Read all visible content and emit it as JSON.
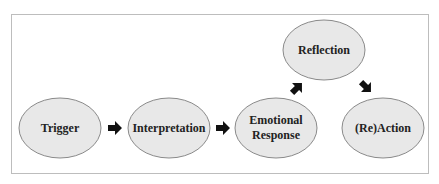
{
  "diagram": {
    "colors": {
      "frame_border": "#bdbdbd",
      "node_fill": "#e8e8e8",
      "node_stroke": "#8a8a8a",
      "arrow": "#111111",
      "text": "#222222"
    },
    "nodes": [
      {
        "id": "trigger",
        "label": "Trigger"
      },
      {
        "id": "interpretation",
        "label": "Interpretation"
      },
      {
        "id": "emotional-response",
        "label_line1": "Emotional",
        "label_line2": "Response"
      },
      {
        "id": "reflection",
        "label": "Reflection"
      },
      {
        "id": "reaction",
        "label": "(Re)Action"
      }
    ],
    "edges": [
      {
        "from": "trigger",
        "to": "interpretation"
      },
      {
        "from": "interpretation",
        "to": "emotional-response"
      },
      {
        "from": "emotional-response",
        "to": "reflection"
      },
      {
        "from": "reflection",
        "to": "reaction"
      }
    ]
  }
}
